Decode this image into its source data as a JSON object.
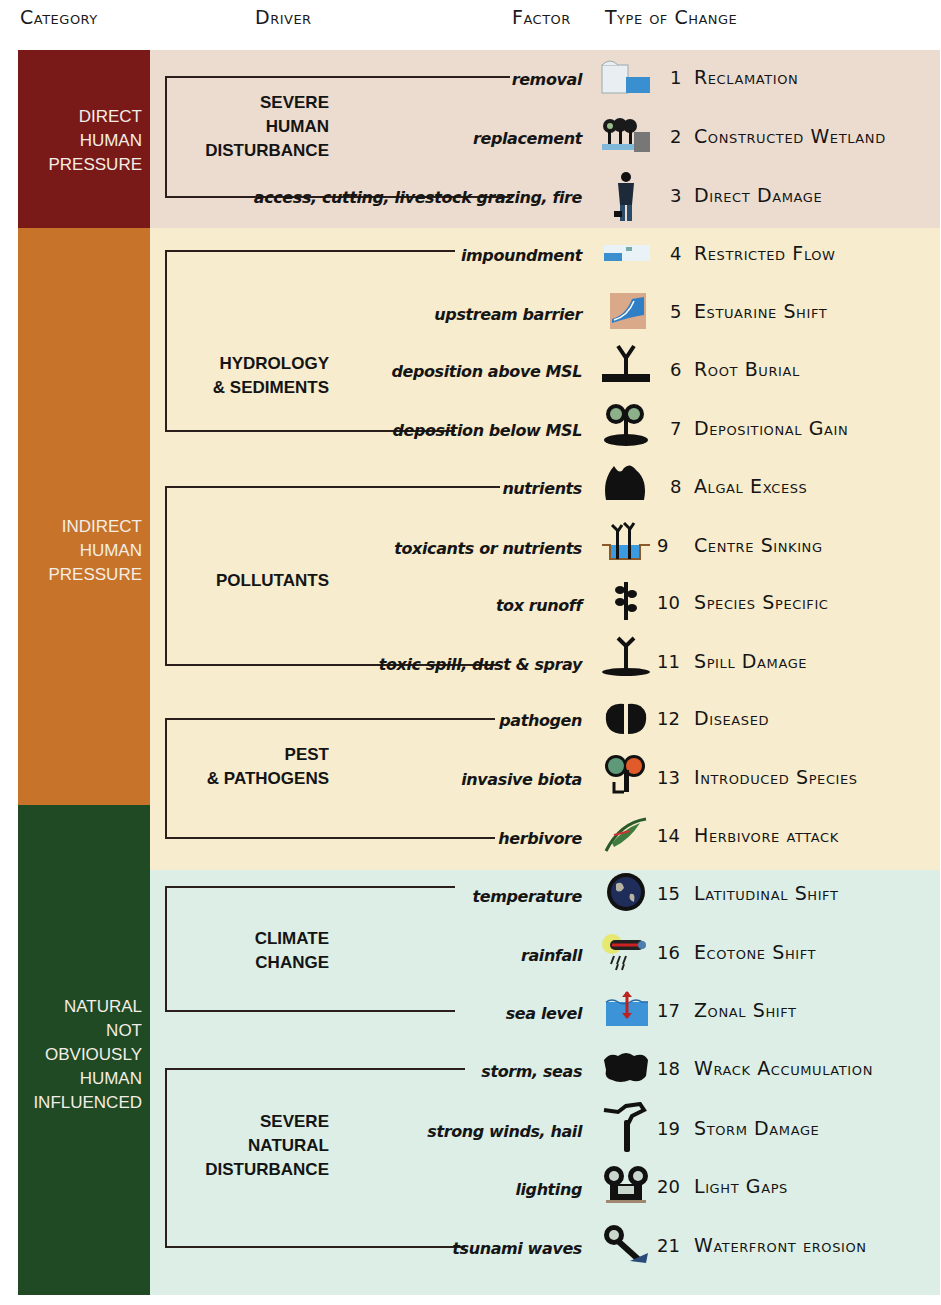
{
  "headers": {
    "category": "Category",
    "driver": "Driver",
    "factor": "Factor",
    "type_of_change": "Type of Change"
  },
  "colors": {
    "direct_category": "#7a1a18",
    "indirect_category": "#c8732a",
    "natural_category": "#1f4a23",
    "direct_band": "#ecdcd0",
    "indirect_band": "#f7eccd",
    "natural_band": "#dceee6"
  },
  "categories": [
    {
      "id": "direct",
      "lines": [
        "DIRECT",
        "HUMAN",
        "PRESSURE"
      ]
    },
    {
      "id": "indirect",
      "lines": [
        "INDIRECT",
        "HUMAN",
        "PRESSURE"
      ]
    },
    {
      "id": "natural",
      "lines": [
        "NATURAL",
        "NOT",
        "OBVIOUSLY",
        "HUMAN",
        "INFLUENCED"
      ]
    }
  ],
  "drivers": [
    {
      "id": "severe-human",
      "lines": [
        "SEVERE",
        "HUMAN",
        "DISTURBANCE"
      ],
      "category": "direct"
    },
    {
      "id": "hydrology",
      "lines": [
        "HYDROLOGY",
        "& SEDIMENTS"
      ],
      "category": "indirect"
    },
    {
      "id": "pollutants",
      "lines": [
        "POLLUTANTS"
      ],
      "category": "indirect"
    },
    {
      "id": "pest",
      "lines": [
        "PEST",
        "& PATHOGENS"
      ],
      "category": "indirect"
    },
    {
      "id": "climate",
      "lines": [
        "CLIMATE",
        "CHANGE"
      ],
      "category": "natural"
    },
    {
      "id": "severe-natural",
      "lines": [
        "SEVERE",
        "NATURAL",
        "DISTURBANCE"
      ],
      "category": "natural"
    }
  ],
  "rows": [
    {
      "num": "1",
      "factor": "removal",
      "change": "Reclamation",
      "icon": "reclamation-icon"
    },
    {
      "num": "2",
      "factor": "replacement",
      "change": "Constructed Wetland",
      "icon": "constructed-wetland-icon"
    },
    {
      "num": "3",
      "factor": "access, cutting, livestock grazing, fire",
      "change": "Direct Damage",
      "icon": "person-icon"
    },
    {
      "num": "4",
      "factor": "impoundment",
      "change": "Restricted Flow",
      "icon": "restricted-flow-icon"
    },
    {
      "num": "5",
      "factor": "upstream barrier",
      "change": "Estuarine Shift",
      "icon": "estuary-icon"
    },
    {
      "num": "6",
      "factor": "deposition above MSL",
      "change": "Root Burial",
      "icon": "root-burial-icon"
    },
    {
      "num": "7",
      "factor": "deposition below MSL",
      "change": "Depositional Gain",
      "icon": "tree-mound-icon"
    },
    {
      "num": "8",
      "factor": "nutrients",
      "change": "Algal Excess",
      "icon": "algae-icon"
    },
    {
      "num": "9",
      "factor": "toxicants or nutrients",
      "change": "Centre Sinking",
      "icon": "sinking-plants-icon"
    },
    {
      "num": "10",
      "factor": "tox runoff",
      "change": "Species Specific",
      "icon": "branch-icon"
    },
    {
      "num": "11",
      "factor": "toxic spill, dust & spray",
      "change": "Spill Damage",
      "icon": "spill-plant-icon"
    },
    {
      "num": "12",
      "factor": "pathogen",
      "change": "Diseased",
      "icon": "diseased-leaves-icon"
    },
    {
      "num": "13",
      "factor": "invasive biota",
      "change": "Introduced Species",
      "icon": "introduced-tree-icon"
    },
    {
      "num": "14",
      "factor": "herbivore",
      "change": "Herbivore attack",
      "icon": "chewed-leaf-icon"
    },
    {
      "num": "15",
      "factor": "temperature",
      "change": "Latitudinal Shift",
      "icon": "globe-icon"
    },
    {
      "num": "16",
      "factor": "rainfall",
      "change": "Ecotone Shift",
      "icon": "rain-cloud-icon"
    },
    {
      "num": "17",
      "factor": "sea level",
      "change": "Zonal Shift",
      "icon": "sea-level-icon"
    },
    {
      "num": "18",
      "factor": "storm, seas",
      "change": "Wrack Accumulation",
      "icon": "wrack-icon"
    },
    {
      "num": "19",
      "factor": "strong winds, hail",
      "change": "Storm Damage",
      "icon": "broken-tree-icon"
    },
    {
      "num": "20",
      "factor": "lighting",
      "change": "Light Gaps",
      "icon": "light-gap-trees-icon"
    },
    {
      "num": "21",
      "factor": "tsunami waves",
      "change": "Waterfront erosion",
      "icon": "fallen-tree-icon"
    }
  ]
}
